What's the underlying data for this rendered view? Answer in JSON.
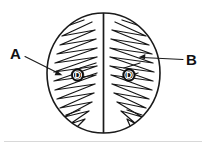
{
  "figure": {
    "colors": {
      "background": "#ffffff",
      "ink": "#1a1a1a",
      "marker_fill": "#0d0d0d",
      "marker_text": "#ffffff",
      "baseline": "#d8d8d8"
    },
    "labels": {
      "left": "A",
      "right": "B"
    },
    "markers": {
      "left": "D",
      "right": "D"
    },
    "icons": {
      "left_leader": "arrow-leader-icon",
      "right_leader": "arrow-leader-icon"
    }
  }
}
